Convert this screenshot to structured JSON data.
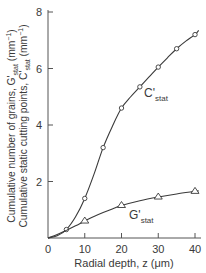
{
  "chart_data": {
    "type": "line",
    "title": "",
    "xlabel": "Radial depth, z (μm)",
    "ylabel_lines": [
      {
        "main": "Cumulative number of grains, G'",
        "sub": "stat",
        "unit": " (mm",
        "sup": "−1",
        "close": ")"
      },
      {
        "main": "Cumulative static cutting points, C'",
        "sub": "stat",
        "unit": " (mm",
        "sup": "−1",
        "close": ")"
      }
    ],
    "xlim": [
      0,
      40
    ],
    "ylim": [
      0,
      8
    ],
    "x_ticks": [
      0,
      10,
      20,
      30,
      40
    ],
    "y_ticks": [
      2,
      4,
      6,
      8
    ],
    "x_tick_labels": [
      "0",
      "10",
      "20",
      "30",
      "40"
    ],
    "y_tick_labels": [
      "2",
      "4",
      "6",
      "8"
    ],
    "grid": false,
    "legend": "inline labels",
    "series": [
      {
        "name": "C'stat",
        "label_main": "C'",
        "label_sub": "stat",
        "marker": "circle",
        "x": [
          5,
          10,
          15,
          20,
          25,
          30,
          35,
          40
        ],
        "values": [
          0.3,
          1.4,
          3.2,
          4.6,
          5.35,
          6.05,
          6.7,
          7.2
        ],
        "curve": [
          [
            0,
            0
          ],
          [
            2.5,
            0.08
          ],
          [
            5,
            0.3
          ],
          [
            7.5,
            0.75
          ],
          [
            10,
            1.4
          ],
          [
            12.5,
            2.25
          ],
          [
            15,
            3.2
          ],
          [
            17.5,
            3.95
          ],
          [
            20,
            4.6
          ],
          [
            22.5,
            5.0
          ],
          [
            25,
            5.35
          ],
          [
            27.5,
            5.7
          ],
          [
            30,
            6.05
          ],
          [
            32.5,
            6.38
          ],
          [
            35,
            6.7
          ],
          [
            37.5,
            6.97
          ],
          [
            40,
            7.2
          ],
          [
            41,
            7.35
          ]
        ],
        "color": "#3a3a3a"
      },
      {
        "name": "G'stat",
        "label_main": "G'",
        "label_sub": "stat",
        "marker": "triangle",
        "x": [
          10,
          20,
          30,
          40
        ],
        "values": [
          0.6,
          1.15,
          1.45,
          1.65
        ],
        "curve": [
          [
            0,
            0
          ],
          [
            2.5,
            0.12
          ],
          [
            5,
            0.27
          ],
          [
            7.5,
            0.43
          ],
          [
            10,
            0.6
          ],
          [
            12.5,
            0.76
          ],
          [
            15,
            0.9
          ],
          [
            17.5,
            1.03
          ],
          [
            20,
            1.15
          ],
          [
            25,
            1.32
          ],
          [
            30,
            1.45
          ],
          [
            35,
            1.56
          ],
          [
            40,
            1.65
          ],
          [
            41,
            1.67
          ]
        ],
        "color": "#3a3a3a"
      }
    ]
  }
}
